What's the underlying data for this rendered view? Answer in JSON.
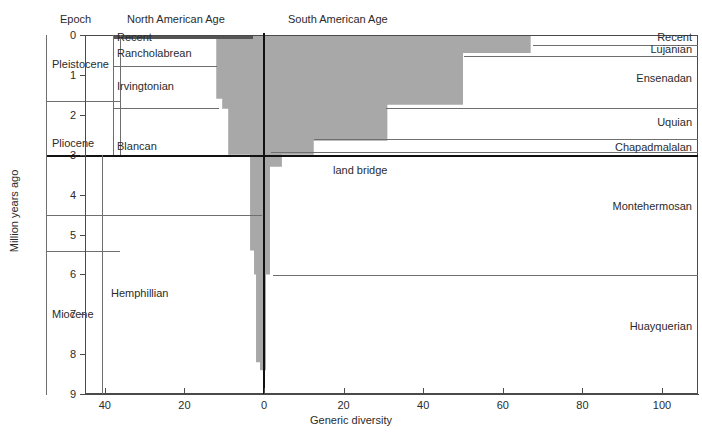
{
  "figure": {
    "y_axis_title": "Million years ago",
    "x_axis_title": "Generic diversity"
  },
  "columns": {
    "epoch_header": "Epoch",
    "north_american_header": "North American Age",
    "south_american_header": "South American Age"
  },
  "labels": {
    "land_bridge": "land bridge"
  },
  "epochs": [
    {
      "name": "Pleistocene",
      "top_ma": 0.0,
      "base_ma": 1.65
    },
    {
      "name": "Pliocene",
      "top_ma": 1.65,
      "base_ma": 4.5
    },
    {
      "name": "Miocene",
      "top_ma": 5.4,
      "base_ma": 9.0
    }
  ],
  "north_american_ages": [
    {
      "name": "Recent",
      "top_ma": 0.0,
      "base_ma": 0.1
    },
    {
      "name": "Rancholabrean",
      "top_ma": 0.1,
      "base_ma": 0.8
    },
    {
      "name": "Irvingtonian",
      "top_ma": 0.8,
      "base_ma": 1.85
    },
    {
      "name": "Blancan",
      "top_ma": 1.85,
      "base_ma": 3.0
    },
    {
      "name": "Hemphillian",
      "top_ma": 3.0,
      "base_ma": 9.0
    }
  ],
  "south_american_ages": [
    {
      "name": "Recent",
      "top_ma": 0.0,
      "base_ma": 0.12
    },
    {
      "name": "Lujanian",
      "top_ma": 0.12,
      "base_ma": 0.45
    },
    {
      "name": "Ensenadan",
      "top_ma": 0.45,
      "base_ma": 1.75
    },
    {
      "name": "Uquian",
      "top_ma": 1.75,
      "base_ma": 2.65
    },
    {
      "name": "Chapadmalalan",
      "top_ma": 2.65,
      "base_ma": 3.0
    },
    {
      "name": "Montehermosan",
      "top_ma": 3.05,
      "base_ma": 6.0
    },
    {
      "name": "Huayquerian",
      "top_ma": 6.0,
      "base_ma": 9.0
    }
  ],
  "chart_data": {
    "type": "area",
    "title": "",
    "xlabel": "Generic diversity",
    "ylabel": "Million years ago",
    "xlim": [
      -45,
      107
    ],
    "ylim": [
      9,
      0
    ],
    "y_inverted": true,
    "grid": false,
    "legend_position": "none",
    "x_ticks": [
      -40,
      -20,
      0,
      20,
      40,
      60,
      80,
      100
    ],
    "x_tick_labels": [
      "40",
      "20",
      "0",
      "20",
      "40",
      "60",
      "80",
      "100"
    ],
    "y_ticks": [
      0,
      1,
      2,
      3,
      4,
      5,
      6,
      7,
      8,
      9
    ],
    "y_tick_labels": [
      "0",
      "1",
      "2",
      "3",
      "4",
      "5",
      "6",
      "7",
      "8",
      "9"
    ],
    "note": "Horizontal bar widths are generic diversity of interchange taxa; values left of 0 are North American, right of 0 are South American. Steps are given as (top_ma, base_ma, north_value, south_value).",
    "series": [
      {
        "name": "North American generic diversity",
        "side": "left",
        "color": "#a8a8a8",
        "steps": [
          {
            "top_ma": 0.0,
            "base_ma": 0.1,
            "value": 12
          },
          {
            "top_ma": 0.1,
            "base_ma": 0.8,
            "value": 12
          },
          {
            "top_ma": 0.8,
            "base_ma": 1.6,
            "value": 12
          },
          {
            "top_ma": 1.6,
            "base_ma": 1.85,
            "value": 10.5
          },
          {
            "top_ma": 1.85,
            "base_ma": 3.0,
            "value": 9
          },
          {
            "top_ma": 3.0,
            "base_ma": 3.3,
            "value": 3.5
          },
          {
            "top_ma": 3.3,
            "base_ma": 5.4,
            "value": 3.5
          },
          {
            "top_ma": 5.4,
            "base_ma": 6.0,
            "value": 2.5
          },
          {
            "top_ma": 6.0,
            "base_ma": 8.2,
            "value": 2.0
          },
          {
            "top_ma": 8.2,
            "base_ma": 8.4,
            "value": 1.0
          }
        ]
      },
      {
        "name": "South American generic diversity",
        "side": "right",
        "color": "#a8a8a8",
        "steps": [
          {
            "top_ma": 0.0,
            "base_ma": 0.12,
            "value": 67
          },
          {
            "top_ma": 0.12,
            "base_ma": 0.45,
            "value": 67
          },
          {
            "top_ma": 0.45,
            "base_ma": 1.75,
            "value": 50
          },
          {
            "top_ma": 1.75,
            "base_ma": 2.65,
            "value": 31
          },
          {
            "top_ma": 2.65,
            "base_ma": 3.0,
            "value": 12.5
          },
          {
            "top_ma": 3.0,
            "base_ma": 3.3,
            "value": 4.5
          },
          {
            "top_ma": 3.3,
            "base_ma": 6.0,
            "value": 1.5
          },
          {
            "top_ma": 6.0,
            "base_ma": 8.4,
            "value": 0.5
          }
        ]
      }
    ]
  }
}
